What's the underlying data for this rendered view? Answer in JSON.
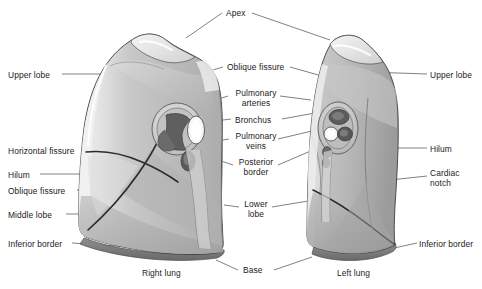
{
  "figure": {
    "style": {
      "background": "#ffffff",
      "text_color": "#1b1b1b",
      "leader_line_color": "#4a4a4a",
      "outline_color": "#3c3c3c",
      "lung_light": "#d9d9d9",
      "lung_mid": "#bfbfbf",
      "lung_dark": "#9d9d9d",
      "lung_darker": "#848484",
      "inferior_border": "#6e6e6e",
      "hilum_white": "#f4f4f4"
    }
  },
  "labels": {
    "left_column": [
      {
        "id": "upper-lobe-right",
        "text": "Upper lobe",
        "x": 8,
        "y": 70,
        "align": "left"
      },
      {
        "id": "horizontal-fissure",
        "text": "Horizontal fissure",
        "x": 8,
        "y": 146,
        "align": "left"
      },
      {
        "id": "hilum-right",
        "text": "Hilum",
        "x": 8,
        "y": 170,
        "align": "left"
      },
      {
        "id": "oblique-fissure-right",
        "text": "Oblique fissure",
        "x": 8,
        "y": 186,
        "align": "left"
      },
      {
        "id": "middle-lobe",
        "text": "Middle lobe",
        "x": 8,
        "y": 210,
        "align": "left"
      },
      {
        "id": "inferior-border-right",
        "text": "Inferior border",
        "x": 8,
        "y": 239,
        "align": "left"
      }
    ],
    "center_column": [
      {
        "id": "oblique-fissure-center",
        "text": "Oblique fissure",
        "x": 227,
        "y": 62
      },
      {
        "id": "pulmonary-arteries",
        "text": "Pulmonary\narteries",
        "x": 232,
        "y": 88
      },
      {
        "id": "bronchus",
        "text": "Bronchus",
        "x": 235,
        "y": 115
      },
      {
        "id": "pulmonary-veins",
        "text": "Pulmonary\nveins",
        "x": 232,
        "y": 131
      },
      {
        "id": "posterior-border",
        "text": "Posterior\nborder",
        "x": 236,
        "y": 157
      },
      {
        "id": "lower-lobe",
        "text": "Lower\nlobe",
        "x": 242,
        "y": 199
      }
    ],
    "right_column": [
      {
        "id": "upper-lobe-left",
        "text": "Upper lobe",
        "x": 430,
        "y": 70,
        "align": "left"
      },
      {
        "id": "hilum-left",
        "text": "Hilum",
        "x": 430,
        "y": 144,
        "align": "left"
      },
      {
        "id": "cardiac-notch",
        "text": "Cardiac\nnotch",
        "x": 430,
        "y": 168,
        "align": "left"
      },
      {
        "id": "inferior-border-left",
        "text": "Inferior border",
        "x": 419,
        "y": 239,
        "align": "left"
      }
    ],
    "top": [
      {
        "id": "apex",
        "text": "Apex",
        "x": 226,
        "y": 8
      }
    ],
    "bottom": [
      {
        "id": "right-lung-caption",
        "text": "Right lung",
        "x": 142,
        "y": 272
      },
      {
        "id": "base",
        "text": "Base",
        "x": 241,
        "y": 267
      },
      {
        "id": "left-lung-caption",
        "text": "Left lung",
        "x": 337,
        "y": 272
      }
    ]
  },
  "anatomy": {
    "right_lung": {
      "name": "Right lung",
      "lobes": [
        "Upper lobe",
        "Middle lobe",
        "Lower lobe"
      ],
      "fissures": [
        "Horizontal fissure",
        "Oblique fissure"
      ],
      "features": [
        "Apex",
        "Hilum",
        "Base",
        "Inferior border",
        "Posterior border"
      ]
    },
    "left_lung": {
      "name": "Left lung",
      "lobes": [
        "Upper lobe",
        "Lower lobe"
      ],
      "fissures": [
        "Oblique fissure"
      ],
      "features": [
        "Apex",
        "Hilum",
        "Cardiac notch",
        "Base",
        "Inferior border"
      ]
    },
    "hilar_structures": [
      "Pulmonary arteries",
      "Bronchus",
      "Pulmonary veins"
    ]
  }
}
